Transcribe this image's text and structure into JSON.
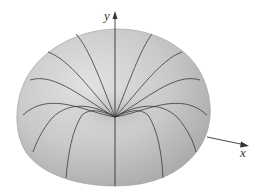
{
  "figure": {
    "type": "3d-surface-plot",
    "axes": {
      "y_label": "y",
      "x_label": "x"
    },
    "colors": {
      "surface_light": "#d9d9d9",
      "surface_mid": "#bdbdbd",
      "surface_dark": "#9e9e9e",
      "mesh_line": "#3a3a3a",
      "axis": "#333333",
      "background": "#ffffff"
    },
    "meridian_count": 13
  }
}
